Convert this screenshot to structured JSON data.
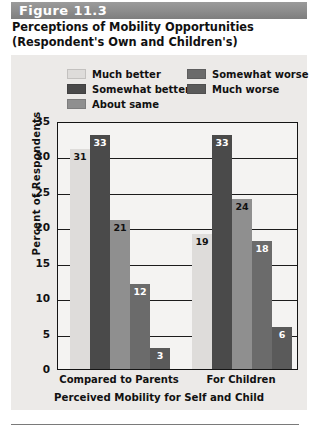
{
  "figure": {
    "number_label": "Figure 11.3",
    "title_line1": "Perceptions of Mobility Opportunities",
    "title_line2": "(Respondent's Own and Children's)"
  },
  "legend": {
    "left_column": [
      {
        "label": "Much better",
        "color": "#dedcda"
      },
      {
        "label": "Somewhat better",
        "color": "#4a4a4a"
      },
      {
        "label": "About same",
        "color": "#8f8f8f"
      }
    ],
    "right_column": [
      {
        "label": "Somewhat worse",
        "color": "#6b6b6b"
      },
      {
        "label": "Much worse",
        "color": "#5a5a5a"
      }
    ]
  },
  "chart_data": {
    "type": "bar",
    "title": "Perceptions of Mobility Opportunities (Respondent's Own and Children's)",
    "xlabel": "Perceived Mobility for Self and Child",
    "ylabel": "Percent of Respondents",
    "categories": [
      "Compared to Parents",
      "For Children"
    ],
    "ylim": [
      0,
      35
    ],
    "yticks": [
      0,
      5,
      10,
      15,
      20,
      25,
      30,
      35
    ],
    "grid": true,
    "legend_position": "top",
    "series": [
      {
        "name": "Much better",
        "color": "#dedcda",
        "values": [
          31,
          19
        ]
      },
      {
        "name": "Somewhat better",
        "color": "#4a4a4a",
        "values": [
          33,
          33
        ]
      },
      {
        "name": "About same",
        "color": "#8f8f8f",
        "values": [
          21,
          24
        ]
      },
      {
        "name": "Somewhat worse",
        "color": "#6b6b6b",
        "values": [
          12,
          18
        ]
      },
      {
        "name": "Much worse",
        "color": "#5a5a5a",
        "values": [
          3,
          6
        ]
      }
    ]
  }
}
